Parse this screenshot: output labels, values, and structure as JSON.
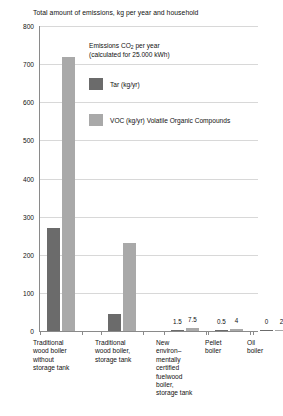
{
  "chart_data": {
    "type": "bar",
    "title": "Total amount of emissions, kg per year and household",
    "xlabel": "",
    "ylabel": "",
    "ylim": [
      0,
      800
    ],
    "yticks": [
      0,
      100,
      200,
      300,
      400,
      500,
      600,
      700,
      800
    ],
    "ytick_labels": [
      "0",
      "100",
      "200",
      "300",
      "400",
      "500",
      "600",
      "700",
      "800"
    ],
    "grid": true,
    "legend_position": "upper-center",
    "annotations": [
      "Emissions  CO2 per year",
      "(calculated for 25.000 kWh)"
    ],
    "categories": [
      "Traditional wood boiler without storage tank",
      "Traditional wood boiler, storage tank",
      "New environ–mentally certified fuelwood boiler, storage tank",
      "Pellet boiler",
      "Oil boiler"
    ],
    "series": [
      {
        "name": "Tar (kg/yr)",
        "color": "#6b6b6b",
        "values": [
          270,
          45,
          1.5,
          0.5,
          0
        ],
        "labels": [
          "",
          "",
          "1.5",
          "0.5",
          "0"
        ]
      },
      {
        "name": "VOC (kg/yr) Volatile Organic Compounds",
        "color": "#a9a9a9",
        "values": [
          720,
          230,
          7.5,
          4,
          2
        ],
        "labels": [
          "",
          "",
          "7.5",
          "4",
          "2"
        ]
      }
    ]
  },
  "legend": {
    "header_line1": "Emissions  CO",
    "header_sub": "2",
    "header_line1_tail": " per year",
    "header_line2": "(calculated for 25.000 kWh)",
    "tar_label": "Tar (kg/yr)",
    "voc_label": "VOC (kg/yr) Volatile Organic Compounds"
  },
  "category_labels": [
    [
      "Traditional",
      "wood boiler",
      "without",
      "storage tank"
    ],
    [
      "Traditional",
      "wood boiler,",
      "storage tank"
    ],
    [
      "New",
      "environ–",
      "mentally",
      "certified",
      "fuelwood",
      "boiler,",
      "storage tank"
    ],
    [
      "Pellet",
      "boiler"
    ],
    [
      "Oil",
      "boiler"
    ]
  ],
  "colors": {
    "tar": "#6b6b6b",
    "voc": "#a9a9a9",
    "grid": "#d8d8d8",
    "axis": "#8a8a8a",
    "text": "#111111",
    "background": "#ffffff"
  }
}
